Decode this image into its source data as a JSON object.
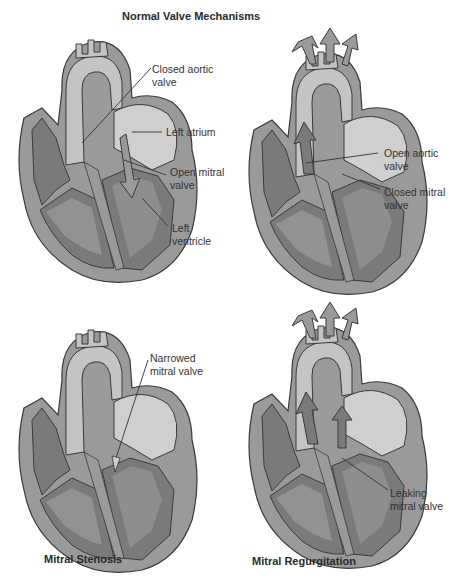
{
  "title": "Normal Valve Mechanisms",
  "panels": [
    {
      "name": "normal-diastole",
      "labels": [
        "Closed aortic valve",
        "Left atrium",
        "Open mitral valve",
        "Left ventricle"
      ],
      "label_lines": {
        "closed_aortic": [
          "Closed aortic",
          "valve"
        ],
        "left_atrium": [
          "Left atrium"
        ],
        "open_mitral": [
          "Open mitral",
          "valve"
        ],
        "left_ventricle": [
          "Left",
          "ventricle"
        ]
      }
    },
    {
      "name": "normal-systole",
      "label_lines": {
        "open_aortic": [
          "Open aortic",
          "valve"
        ],
        "closed_mitral": [
          "Closed mitral",
          "valve"
        ]
      }
    },
    {
      "name": "mitral-stenosis",
      "caption": "Mitral Stenosis",
      "label_lines": {
        "narrowed_mitral": [
          "Narrowed",
          "mitral valve"
        ]
      }
    },
    {
      "name": "mitral-regurgitation",
      "caption": "Mitral Regurgitation",
      "label_lines": {
        "leaking_mitral": [
          "Leaking",
          "mitral valve"
        ]
      }
    }
  ],
  "colors": {
    "outer_wall": "#9a9a9a",
    "chamber_dark": "#7a7a7a",
    "chamber_light": "#a6a6a6",
    "aorta": "#c4c4c4",
    "atrium": "#cfcfcf",
    "outline": "#3a3a3a"
  }
}
